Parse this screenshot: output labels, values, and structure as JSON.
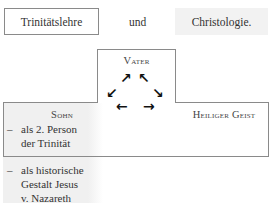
{
  "header": {
    "left": "Trinitätslehre",
    "middle": "und",
    "right": "Christologie."
  },
  "nodes": {
    "vater": "Vater",
    "sohn": "Sohn",
    "geist": "Heiliger Geist"
  },
  "sohn_items": [
    {
      "dash": "–",
      "lines": [
        "als 2. Person",
        "der Trinität"
      ]
    },
    {
      "dash": "–",
      "lines": [
        "als historische",
        "Gestalt Jesus",
        "v. Nazareth"
      ]
    }
  ],
  "arrows": {
    "ne": "➚",
    "nw": "➚",
    "sw": "➚",
    "se": "➚",
    "w": "←",
    "e": "→"
  },
  "colors": {
    "border": "#8a8a8a",
    "gray_fill": "#f2f2f2"
  }
}
